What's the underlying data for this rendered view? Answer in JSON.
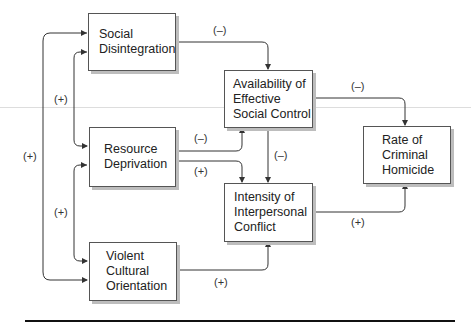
{
  "nodes": {
    "social_disintegration": "Social Disintegration",
    "resource_deprivation": "Resource Deprivation",
    "violent_cultural_orientation": "Violent Cultural Orientation",
    "availability_social_control": "Availability of Effective Social Control",
    "intensity_conflict": "Intensity of Interpersonal Conflict",
    "rate_homicide": "Rate of Criminal Homicide"
  },
  "lines": {
    "sd": [
      "Social",
      "Disintegration"
    ],
    "rd": [
      "Resource",
      "Deprivation"
    ],
    "vco": [
      "Violent",
      "Cultural",
      "Orientation"
    ],
    "asc": [
      "Availability of",
      "Effective",
      "Social Control"
    ],
    "iic": [
      "Intensity of",
      "Interpersonal",
      "Conflict"
    ],
    "rch": [
      "Rate of",
      "Criminal",
      "Homicide"
    ]
  },
  "edge_labels": {
    "sd_to_asc": "(–)",
    "rd_to_asc": "(–)",
    "rd_to_iic": "(+)",
    "asc_to_iic": "(–)",
    "asc_to_rch": "(–)",
    "iic_to_rch": "(+)",
    "vco_to_iic": "(+)",
    "sd_rd": "(+)",
    "rd_vco": "(+)",
    "sd_vco": "(+)"
  }
}
